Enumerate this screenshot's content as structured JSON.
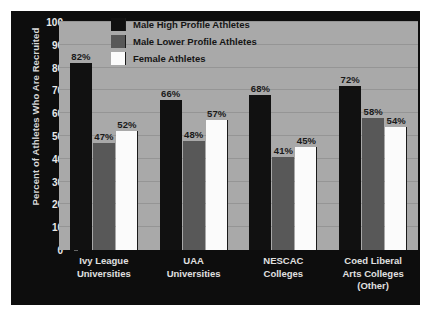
{
  "chart_data": {
    "type": "bar",
    "title": "",
    "subtitle": "",
    "xlabel": "",
    "ylabel": "Percent of Athletes Who Are Recruited",
    "ylim": [
      0,
      100
    ],
    "ytick_step": 10,
    "yticks": [
      "100",
      "90",
      "80",
      "70",
      "60",
      "50",
      "40",
      "30",
      "20",
      "10",
      "0"
    ],
    "grid": true,
    "legend_position": "top-center",
    "categories": [
      [
        "Ivy League",
        "Universities"
      ],
      [
        "UAA",
        "Universities"
      ],
      [
        "NESCAC",
        "Colleges"
      ],
      [
        "Coed Liberal",
        "Arts Colleges",
        "(Other)"
      ]
    ],
    "series": [
      {
        "name": "Male High Profile Athletes",
        "color": "#111111",
        "values": [
          82,
          66,
          68,
          72
        ],
        "labels": [
          "82%",
          "66%",
          "68%",
          "72%"
        ]
      },
      {
        "name": "Male Lower Profile Athletes",
        "color": "#585858",
        "values": [
          47,
          48,
          41,
          58
        ],
        "labels": [
          "47%",
          "48%",
          "41%",
          "58%"
        ]
      },
      {
        "name": "Female Athletes",
        "color": "#fbfbfb",
        "values": [
          52,
          57,
          45,
          54
        ],
        "labels": [
          "52%",
          "57%",
          "45%",
          "54%"
        ]
      }
    ],
    "colors": {
      "panel_background": "#0d0d0d",
      "plot_background": "#a9a9a9",
      "gridline": "#959595",
      "axis_text": "#e8e8e8",
      "data_label": "#1a1a1a"
    }
  }
}
